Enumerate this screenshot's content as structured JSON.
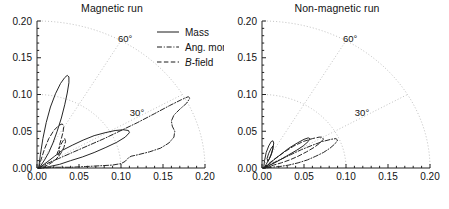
{
  "figure": {
    "width": 449,
    "height": 209,
    "background": "#ffffff",
    "foreground": "#1a1a1a",
    "grid_color": "#b9b9b9"
  },
  "panels": [
    {
      "id": "magnetic",
      "title": "Magnetic run",
      "has_legend": true
    },
    {
      "id": "non-magnetic",
      "title": "Non-magnetic run",
      "has_legend": false
    }
  ],
  "legend": {
    "entries": [
      {
        "label": "Mass",
        "style": "solid",
        "italic_head": ""
      },
      {
        "label": "Ang. mom.",
        "style": "dashdot",
        "italic_head": ""
      },
      {
        "label": "-field",
        "style": "dashed",
        "italic_head": "B"
      }
    ]
  },
  "axes": {
    "x_ticks": [
      "0.00",
      "0.05",
      "0.10",
      "0.15",
      "0.20"
    ],
    "y_ticks": [
      "0.00",
      "0.05",
      "0.10",
      "0.15",
      "0.20"
    ],
    "xlim": [
      0.0,
      0.2
    ],
    "ylim": [
      0.0,
      0.2
    ],
    "xlabel": "",
    "ylabel": "",
    "minor_ticks_per_interval": 5
  },
  "polar_grid": {
    "angle_labels": [
      "30°",
      "60°"
    ],
    "angles_deg": [
      30,
      60
    ],
    "radii": [
      0.1,
      0.2
    ],
    "style": "dotted"
  },
  "chart_data": {
    "type": "line",
    "xlabel": "",
    "ylabel": "",
    "xlim": [
      0.0,
      0.2
    ],
    "ylim": [
      0.0,
      0.2
    ],
    "grid": "polar-dotted",
    "legend_position": "top-right-of-left-panel",
    "panels": [
      {
        "name": "Magnetic run",
        "series": [
          {
            "name": "Mass",
            "style": "solid",
            "comment": "two narrow elongated loops from origin: one steep reaching ~(0.035,0.125), one shallow reaching ~(0.11,0.052)",
            "points": [
              [
                0.002,
                0.0
              ],
              [
                0.004,
                0.018
              ],
              [
                0.007,
                0.04
              ],
              [
                0.011,
                0.062
              ],
              [
                0.016,
                0.083
              ],
              [
                0.022,
                0.101
              ],
              [
                0.028,
                0.115
              ],
              [
                0.033,
                0.123
              ],
              [
                0.036,
                0.126
              ],
              [
                0.038,
                0.124
              ],
              [
                0.038,
                0.116
              ],
              [
                0.036,
                0.102
              ],
              [
                0.033,
                0.086
              ],
              [
                0.029,
                0.068
              ],
              [
                0.024,
                0.05
              ],
              [
                0.019,
                0.034
              ],
              [
                0.014,
                0.021
              ],
              [
                0.009,
                0.011
              ],
              [
                0.005,
                0.004
              ],
              [
                0.002,
                0.0
              ],
              [
                0.006,
                0.003
              ],
              [
                0.013,
                0.009
              ],
              [
                0.021,
                0.016
              ],
              [
                0.03,
                0.024
              ],
              [
                0.042,
                0.031
              ],
              [
                0.055,
                0.038
              ],
              [
                0.068,
                0.044
              ],
              [
                0.081,
                0.048
              ],
              [
                0.093,
                0.051
              ],
              [
                0.103,
                0.052
              ],
              [
                0.109,
                0.051
              ],
              [
                0.11,
                0.048
              ],
              [
                0.105,
                0.042
              ],
              [
                0.095,
                0.035
              ],
              [
                0.082,
                0.028
              ],
              [
                0.068,
                0.021
              ],
              [
                0.054,
                0.015
              ],
              [
                0.04,
                0.01
              ],
              [
                0.027,
                0.005
              ],
              [
                0.015,
                0.002
              ],
              [
                0.006,
                0.0
              ],
              [
                0.002,
                0.0
              ]
            ]
          },
          {
            "name": "Ang. mom.",
            "style": "dashdot",
            "comment": "large wedge-shaped loop reaching ~(0.18,0.097) with wavy inner return through ~(0.16,0.055)",
            "points": [
              [
                0.002,
                0.0
              ],
              [
                0.012,
                0.006
              ],
              [
                0.026,
                0.013
              ],
              [
                0.042,
                0.021
              ],
              [
                0.06,
                0.03
              ],
              [
                0.08,
                0.04
              ],
              [
                0.1,
                0.051
              ],
              [
                0.12,
                0.062
              ],
              [
                0.14,
                0.074
              ],
              [
                0.158,
                0.085
              ],
              [
                0.172,
                0.093
              ],
              [
                0.18,
                0.097
              ],
              [
                0.182,
                0.095
              ],
              [
                0.178,
                0.088
              ],
              [
                0.17,
                0.08
              ],
              [
                0.163,
                0.072
              ],
              [
                0.16,
                0.064
              ],
              [
                0.161,
                0.057
              ],
              [
                0.164,
                0.05
              ],
              [
                0.163,
                0.042
              ],
              [
                0.157,
                0.034
              ],
              [
                0.147,
                0.027
              ],
              [
                0.134,
                0.022
              ],
              [
                0.12,
                0.018
              ],
              [
                0.112,
                0.016
              ],
              [
                0.108,
                0.013
              ],
              [
                0.105,
                0.009
              ],
              [
                0.1,
                0.006
              ],
              [
                0.09,
                0.004
              ],
              [
                0.075,
                0.003
              ],
              [
                0.058,
                0.002
              ],
              [
                0.04,
                0.001
              ],
              [
                0.022,
                0.001
              ],
              [
                0.008,
                0.0
              ],
              [
                0.002,
                0.0
              ]
            ]
          },
          {
            "name": "B-field",
            "style": "dashed",
            "comment": "steep narrow spike to ~(0.030,0.060) then shallow return along lower edge",
            "points": [
              [
                0.002,
                0.0
              ],
              [
                0.005,
                0.012
              ],
              [
                0.009,
                0.026
              ],
              [
                0.014,
                0.04
              ],
              [
                0.02,
                0.051
              ],
              [
                0.026,
                0.058
              ],
              [
                0.03,
                0.06
              ],
              [
                0.032,
                0.057
              ],
              [
                0.031,
                0.049
              ],
              [
                0.029,
                0.04
              ],
              [
                0.027,
                0.032
              ],
              [
                0.026,
                0.026
              ],
              [
                0.028,
                0.031
              ],
              [
                0.031,
                0.037
              ],
              [
                0.033,
                0.04
              ],
              [
                0.034,
                0.036
              ],
              [
                0.032,
                0.028
              ],
              [
                0.029,
                0.021
              ],
              [
                0.026,
                0.016
              ],
              [
                0.024,
                0.02
              ],
              [
                0.026,
                0.025
              ],
              [
                0.027,
                0.022
              ],
              [
                0.025,
                0.015
              ],
              [
                0.021,
                0.01
              ],
              [
                0.017,
                0.007
              ],
              [
                0.013,
                0.004
              ],
              [
                0.008,
                0.002
              ],
              [
                0.003,
                0.0
              ],
              [
                0.002,
                0.0
              ]
            ]
          }
        ]
      },
      {
        "name": "Non-magnetic run",
        "series": [
          {
            "name": "Mass",
            "style": "solid",
            "comment": "small steep loop to ~(0.012,0.037) plus flatter loop to ~(0.055,0.041)",
            "points": [
              [
                0.002,
                0.0
              ],
              [
                0.003,
                0.01
              ],
              [
                0.005,
                0.021
              ],
              [
                0.008,
                0.03
              ],
              [
                0.011,
                0.036
              ],
              [
                0.013,
                0.037
              ],
              [
                0.014,
                0.034
              ],
              [
                0.013,
                0.027
              ],
              [
                0.011,
                0.019
              ],
              [
                0.009,
                0.013
              ],
              [
                0.007,
                0.009
              ],
              [
                0.006,
                0.013
              ],
              [
                0.008,
                0.02
              ],
              [
                0.011,
                0.027
              ],
              [
                0.013,
                0.03
              ],
              [
                0.013,
                0.026
              ],
              [
                0.011,
                0.018
              ],
              [
                0.008,
                0.011
              ],
              [
                0.005,
                0.005
              ],
              [
                0.003,
                0.001
              ],
              [
                0.002,
                0.0
              ],
              [
                0.007,
                0.004
              ],
              [
                0.014,
                0.011
              ],
              [
                0.023,
                0.019
              ],
              [
                0.032,
                0.027
              ],
              [
                0.042,
                0.034
              ],
              [
                0.05,
                0.039
              ],
              [
                0.055,
                0.041
              ],
              [
                0.057,
                0.04
              ],
              [
                0.055,
                0.036
              ],
              [
                0.049,
                0.03
              ],
              [
                0.041,
                0.024
              ],
              [
                0.032,
                0.018
              ],
              [
                0.023,
                0.012
              ],
              [
                0.015,
                0.007
              ],
              [
                0.008,
                0.003
              ],
              [
                0.003,
                0.0
              ],
              [
                0.002,
                0.0
              ]
            ]
          },
          {
            "name": "Ang. mom.",
            "style": "dashdot",
            "comment": "loop extending to ~(0.088,0.040) with lower return near axis",
            "points": [
              [
                0.002,
                0.0
              ],
              [
                0.01,
                0.005
              ],
              [
                0.021,
                0.011
              ],
              [
                0.034,
                0.018
              ],
              [
                0.047,
                0.025
              ],
              [
                0.06,
                0.031
              ],
              [
                0.072,
                0.036
              ],
              [
                0.082,
                0.039
              ],
              [
                0.088,
                0.04
              ],
              [
                0.09,
                0.038
              ],
              [
                0.087,
                0.033
              ],
              [
                0.081,
                0.027
              ],
              [
                0.073,
                0.021
              ],
              [
                0.064,
                0.016
              ],
              [
                0.054,
                0.011
              ],
              [
                0.043,
                0.007
              ],
              [
                0.032,
                0.004
              ],
              [
                0.021,
                0.002
              ],
              [
                0.011,
                0.001
              ],
              [
                0.004,
                0.0
              ],
              [
                0.002,
                0.0
              ]
            ]
          },
          {
            "name": "B-field",
            "style": "dashed",
            "comment": "mid-size loop reaching ~(0.072,0.042)",
            "points": [
              [
                0.002,
                0.0
              ],
              [
                0.008,
                0.006
              ],
              [
                0.017,
                0.014
              ],
              [
                0.027,
                0.022
              ],
              [
                0.038,
                0.03
              ],
              [
                0.049,
                0.036
              ],
              [
                0.06,
                0.04
              ],
              [
                0.068,
                0.042
              ],
              [
                0.072,
                0.042
              ],
              [
                0.073,
                0.039
              ],
              [
                0.069,
                0.034
              ],
              [
                0.062,
                0.028
              ],
              [
                0.053,
                0.022
              ],
              [
                0.043,
                0.016
              ],
              [
                0.033,
                0.011
              ],
              [
                0.023,
                0.007
              ],
              [
                0.014,
                0.004
              ],
              [
                0.006,
                0.001
              ],
              [
                0.002,
                0.0
              ]
            ]
          }
        ]
      }
    ]
  }
}
